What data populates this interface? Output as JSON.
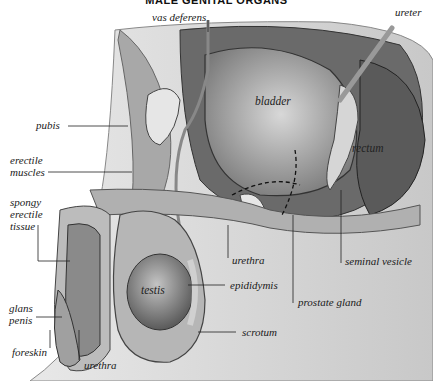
{
  "title": "MALE GENITAL ORGANS",
  "labels": {
    "vas_deferens": "vas deferens",
    "ureter": "ureter",
    "bladder": "bladder",
    "pubis": "pubis",
    "rectum": "rectum",
    "erectile_muscles": [
      "erectile",
      "muscles"
    ],
    "spongy_erectile_tissue": [
      "spongy",
      "erectile",
      "tissue"
    ],
    "urethra_upper": "urethra",
    "seminal_vesicle": "seminal vesicle",
    "testis": "testis",
    "epididymis": "epididymis",
    "prostate_gland": "prostate gland",
    "glans_penis": [
      "glans",
      "penis"
    ],
    "scrotum": "scrotum",
    "foreskin": "foreskin",
    "urethra_lower": "urethra"
  }
}
